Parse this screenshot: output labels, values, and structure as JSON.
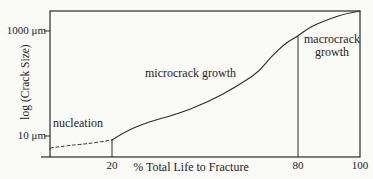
{
  "figure": {
    "background_color": "#fafaf7",
    "ink_color": "#2b2b2b"
  },
  "chart_data": {
    "type": "line",
    "title": "",
    "xlabel": "% Total Life to Fracture",
    "ylabel": "log (Crack Size)",
    "xlim": [
      0,
      100
    ],
    "x_ticks": [
      20,
      80,
      100
    ],
    "y_scale": "log",
    "y_ticks": [
      {
        "label": "1000 μm",
        "value_um": 1000
      },
      {
        "label": "10 μm",
        "value_um": 10
      }
    ],
    "regions": [
      {
        "label": "nucleation",
        "x_range_pct": [
          0,
          20
        ],
        "curve_style": "dashed"
      },
      {
        "label": "microcrack growth",
        "x_range_pct": [
          20,
          80
        ],
        "curve_style": "solid"
      },
      {
        "label": "macrocrack growth",
        "x_range_pct": [
          80,
          100
        ],
        "curve_style": "solid"
      }
    ],
    "stage_boundaries_pct": [
      20,
      80
    ],
    "series": [
      {
        "name": "crack size vs life fraction",
        "dashed_until_pct": 20,
        "points": [
          {
            "pct": 0,
            "crack_um": 5.9
          },
          {
            "pct": 5,
            "crack_um": 6.5
          },
          {
            "pct": 11,
            "crack_um": 7.0
          },
          {
            "pct": 16,
            "crack_um": 7.7
          },
          {
            "pct": 20,
            "crack_um": 8.4
          },
          {
            "pct": 24,
            "crack_um": 12
          },
          {
            "pct": 31,
            "crack_um": 18
          },
          {
            "pct": 40,
            "crack_um": 25
          },
          {
            "pct": 51,
            "crack_um": 44
          },
          {
            "pct": 60,
            "crack_um": 86
          },
          {
            "pct": 67,
            "crack_um": 160
          },
          {
            "pct": 71,
            "crack_um": 310
          },
          {
            "pct": 76,
            "crack_um": 590
          },
          {
            "pct": 80,
            "crack_um": 800
          },
          {
            "pct": 83,
            "crack_um": 1090
          },
          {
            "pct": 86,
            "crack_um": 1360
          },
          {
            "pct": 91,
            "crack_um": 1770
          },
          {
            "pct": 95,
            "crack_um": 2110
          },
          {
            "pct": 100,
            "crack_um": 2400
          }
        ]
      }
    ]
  }
}
